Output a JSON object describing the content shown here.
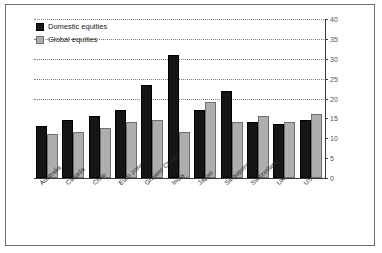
{
  "chart_data": {
    "type": "bar",
    "title": "",
    "xlabel": "",
    "ylabel": "",
    "ylim": [
      0,
      40
    ],
    "y_ticks": [
      0,
      5,
      10,
      15,
      20,
      25,
      30,
      35,
      40
    ],
    "grid": true,
    "grid_lines_at": [
      20,
      25,
      30,
      35,
      40
    ],
    "legend_position": "top-left",
    "axis_position": "right",
    "categories": [
      "Australia",
      "Canada",
      "Chile",
      "Euro zone",
      "Greater China",
      "India",
      "Japan",
      "Singapore",
      "Switzerland",
      "UK",
      "US"
    ],
    "series": [
      {
        "name": "Domestic equities",
        "color": "#151515",
        "values": [
          13,
          14.5,
          15.5,
          17,
          23.5,
          31,
          17,
          22,
          14,
          13.5,
          14.5
        ]
      },
      {
        "name": "Global equities",
        "color": "#aeaeae",
        "values": [
          11,
          11.5,
          12.5,
          14,
          14.5,
          11.5,
          19,
          14,
          15.5,
          14,
          16
        ]
      }
    ]
  },
  "legend": {
    "items": [
      {
        "label": "Domestic equities",
        "swatch": "domestic"
      },
      {
        "label": "Global equities",
        "swatch": "global"
      }
    ]
  }
}
